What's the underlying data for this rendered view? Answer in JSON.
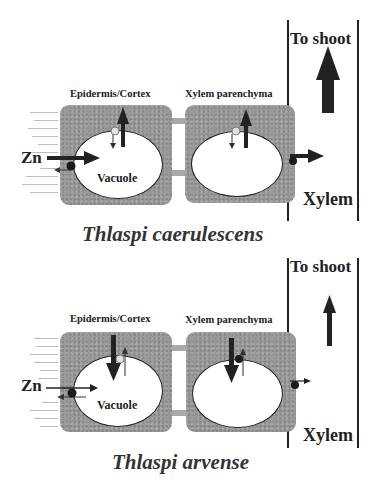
{
  "panels": [
    {
      "id": "caerulescens",
      "species": "Thlaspi caerulescens",
      "to_shoot_label": "To shoot",
      "xylem_label": "Xylem",
      "cell_labels": {
        "epidermis_cortex": "Epidermis/Cortex",
        "xylem_parenchyma": "Xylem parenchyma",
        "vacuole": "Vacuole"
      },
      "zn_label": "Zn",
      "to_shoot_arrow": "thick",
      "tonoplast_flux": "efflux-dominant (thick up arrow, thin down)",
      "xylem_loading": "strong"
    },
    {
      "id": "arvense",
      "species": "Thlaspi arvense",
      "to_shoot_label": "To shoot",
      "xylem_label": "Xylem",
      "cell_labels": {
        "epidermis_cortex": "Epidermis/Cortex",
        "xylem_parenchyma": "Xylem parenchyma",
        "vacuole": "Vacuole"
      },
      "zn_label": "Zn",
      "to_shoot_arrow": "thin",
      "tonoplast_flux": "influx-dominant (thick down arrow, thin up)",
      "xylem_loading": "weak"
    }
  ],
  "colors": {
    "cytoplasm": "#9a9a9a",
    "arrow": "#222222",
    "transporter_dark": "#1a1a1a",
    "transporter_light": "#d8d8d8"
  },
  "caption_partial": ""
}
